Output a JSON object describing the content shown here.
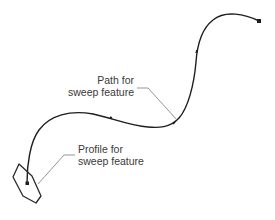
{
  "diagram": {
    "colors": {
      "background": "#ffffff",
      "curve": "#1e1e1e",
      "leader": "#8a8a8a",
      "text": "#3a3a3a"
    },
    "path_label": {
      "line1": "Path for",
      "line2": "sweep feature"
    },
    "profile_label": {
      "line1": "Profile for",
      "line2": "sweep feature"
    },
    "shapes": {
      "path_curve": "sweep-path-spline",
      "profile_shape": "hexagon-profile",
      "end_markers": [
        "square-endpoint-top-right",
        "square-endpoint-profile-center"
      ]
    }
  }
}
